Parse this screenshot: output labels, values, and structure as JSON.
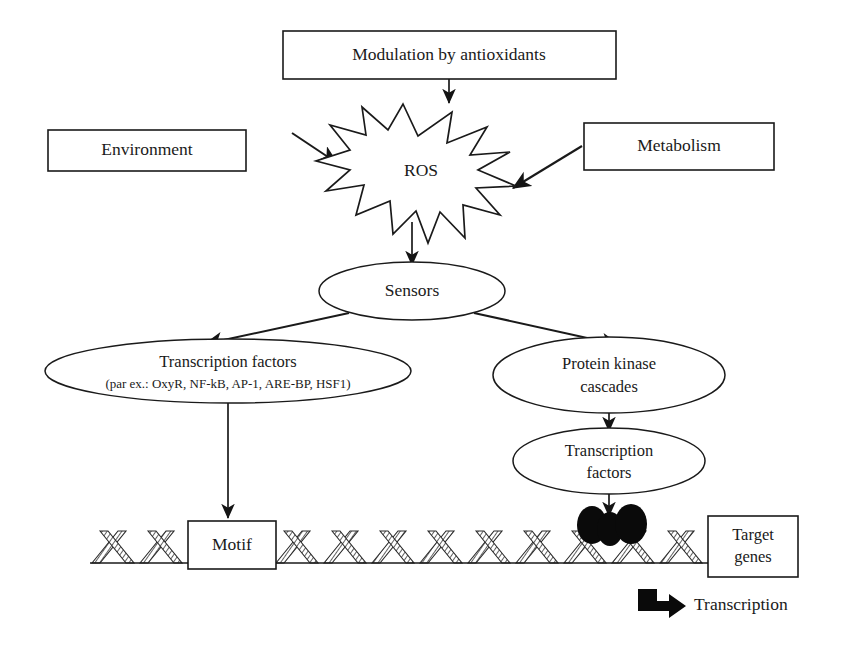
{
  "figure": {
    "background_color": "#ffffff",
    "line_color": "#1a1a1a",
    "blob_color": "#0a0a0a"
  },
  "nodes": {
    "modulation": {
      "label": "Modulation by antioxidants",
      "shape": "rect"
    },
    "environment": {
      "label": "Environment",
      "shape": "rect"
    },
    "metabolism": {
      "label": "Metabolism",
      "shape": "rect"
    },
    "ros": {
      "label": "ROS",
      "shape": "starburst"
    },
    "sensors": {
      "label": "Sensors",
      "shape": "ellipse"
    },
    "transcription_factors_left": {
      "label": "Transcription factors",
      "sublabel": "(par ex.: OxyR, NF-kB, AP-1, ARE-BP, HSF1)",
      "shape": "ellipse"
    },
    "protein_kinase": {
      "label_line1": "Protein kinase",
      "label_line2": "cascades",
      "shape": "ellipse"
    },
    "transcription_factors_right": {
      "label_line1": "Transcription",
      "label_line2": "factors",
      "shape": "ellipse"
    },
    "motif": {
      "label": "Motif",
      "shape": "rect"
    },
    "target_genes": {
      "label_line1": "Target",
      "label_line2": "genes",
      "shape": "rect"
    },
    "transcription_output": {
      "label": "Transcription",
      "shape": "text"
    }
  },
  "edges": [
    {
      "from": "modulation",
      "to": "ros",
      "style": "straight-arrow"
    },
    {
      "from": "environment",
      "to": "ros",
      "style": "diagonal-arrow"
    },
    {
      "from": "metabolism",
      "to": "ros",
      "style": "diagonal-arrow"
    },
    {
      "from": "ros",
      "to": "sensors",
      "style": "straight-arrow"
    },
    {
      "from": "sensors",
      "to": "transcription_factors_left",
      "style": "diagonal-arrow"
    },
    {
      "from": "sensors",
      "to": "protein_kinase",
      "style": "diagonal-arrow"
    },
    {
      "from": "transcription_factors_left",
      "to": "motif",
      "style": "straight-arrow"
    },
    {
      "from": "protein_kinase",
      "to": "transcription_factors_right",
      "style": "straight-arrow"
    },
    {
      "from": "transcription_factors_right",
      "to": "dna_blobs",
      "style": "straight-arrow"
    },
    {
      "from": "dna_blobs",
      "to": "transcription_output",
      "style": "bent-thick-arrow"
    }
  ],
  "dna": {
    "description": "double-helix ribbon strand",
    "hatched": true,
    "bound_blob_count": 3
  }
}
